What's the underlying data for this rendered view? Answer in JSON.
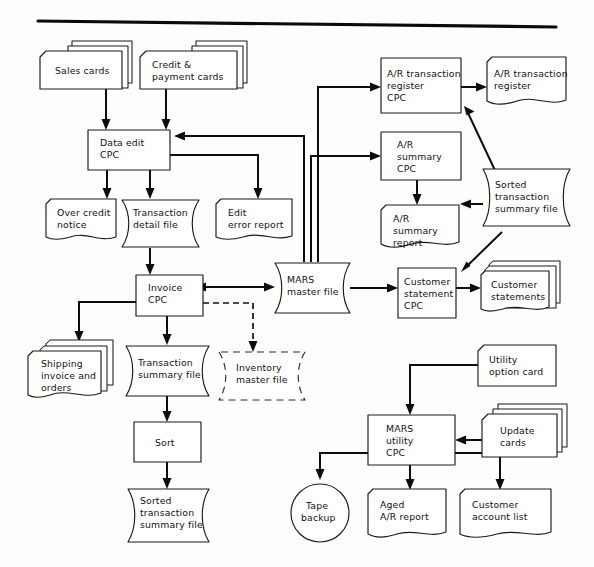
{
  "figure": {
    "rule_color": "#0a0a0a",
    "line_color": "#0d0d0d",
    "shape_fill": "#ffffff",
    "shape_stroke": "#1a1a1a"
  },
  "nodes": {
    "sales_cards": {
      "label": "Sales cards",
      "shape": "card-deck"
    },
    "credit_payment_cards": {
      "label_line1": "Credit &",
      "label_line2": "payment cards",
      "shape": "card-deck"
    },
    "data_edit_cpc": {
      "label_line1": "Data edit",
      "label_line2": "CPC",
      "shape": "process"
    },
    "over_credit_notice": {
      "label_line1": "Over credit",
      "label_line2": "notice",
      "shape": "document"
    },
    "transaction_detail_file": {
      "label_line1": "Transaction",
      "label_line2": "detail file",
      "shape": "tape-file"
    },
    "edit_error_report": {
      "label_line1": "Edit",
      "label_line2": "error report",
      "shape": "document"
    },
    "invoice_cpc": {
      "label_line1": "Invoice",
      "label_line2": "CPC",
      "shape": "process"
    },
    "shipping_invoice_and_orders": {
      "label_line1": "Shipping",
      "label_line2": "invoice and",
      "label_line3": "orders",
      "shape": "document-stack"
    },
    "transaction_summary_file": {
      "label_line1": "Transaction",
      "label_line2": "summary file",
      "shape": "tape-file"
    },
    "sort": {
      "label": "Sort",
      "shape": "process"
    },
    "sorted_transaction_summary_file_left": {
      "label_line1": "Sorted",
      "label_line2": "transaction",
      "label_line3": "summary file",
      "shape": "tape-file"
    },
    "mars_master_file": {
      "label_line1": "MARS",
      "label_line2": "master file",
      "shape": "tape-file"
    },
    "inventory_master_file": {
      "label_line1": "Inventory",
      "label_line2": "master file",
      "shape": "tape-file-dashed"
    },
    "ar_transaction_register_cpc": {
      "label_line1": "A/R transaction",
      "label_line2": "register",
      "label_line3": "CPC",
      "shape": "process"
    },
    "ar_transaction_register": {
      "label_line1": "A/R transaction",
      "label_line2": "register",
      "shape": "document"
    },
    "ar_summary_cpc": {
      "label_line1": "A/R",
      "label_line2": "summary",
      "label_line3": "CPC",
      "shape": "process"
    },
    "ar_summary_report": {
      "label_line1": "A/R",
      "label_line2": "summary",
      "label_line3": "report",
      "shape": "document"
    },
    "sorted_transaction_summary_file_right": {
      "label_line1": "Sorted",
      "label_line2": "transaction",
      "label_line3": "summary file",
      "shape": "tape-file"
    },
    "customer_statement_cpc": {
      "label_line1": "Customer",
      "label_line2": "statement",
      "label_line3": "CPC",
      "shape": "process"
    },
    "customer_statements": {
      "label_line1": "Customer",
      "label_line2": "statements",
      "shape": "document-stack"
    },
    "utility_option_card": {
      "label_line1": "Utility",
      "label_line2": "option card",
      "shape": "card"
    },
    "update_cards": {
      "label_line1": "Update",
      "label_line2": "cards",
      "shape": "card-deck"
    },
    "mars_utility_cpc": {
      "label_line1": "MARS",
      "label_line2": "utility",
      "label_line3": "CPC",
      "shape": "process"
    },
    "tape_backup": {
      "label_line1": "Tape",
      "label_line2": "backup",
      "shape": "circle"
    },
    "aged_ar_report": {
      "label_line1": "Aged",
      "label_line2": "A/R report",
      "shape": "document"
    },
    "customer_account_list": {
      "label_line1": "Customer",
      "label_line2": "account list",
      "shape": "document"
    }
  }
}
